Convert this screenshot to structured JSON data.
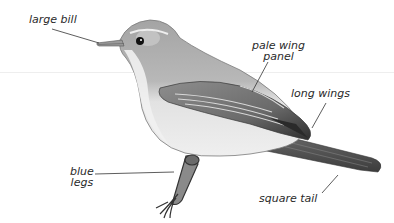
{
  "illustration": {
    "subject": "songbird (warbler) side view, grayscale",
    "colors": {
      "background": "#ffffff",
      "ink": "#2a2a2a",
      "bird_upper": "#9a9a9a",
      "bird_under": "#e6e6e6",
      "wing_dark": "#3a3a3a"
    }
  },
  "labels": {
    "bill": "large bill",
    "wing_panel_line1": "pale wing",
    "wing_panel_line2": "panel",
    "wings": "long wings",
    "legs_line1": "blue",
    "legs_line2": "legs",
    "tail": "square tail"
  }
}
